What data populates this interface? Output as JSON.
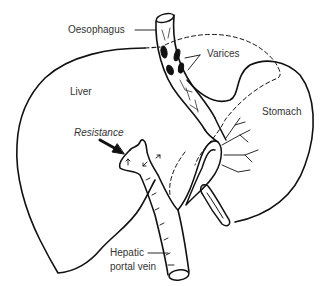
{
  "diagram": {
    "type": "anatomical illustration",
    "labels": {
      "oesophagus": "Oesophagus",
      "varices": "Varices",
      "liver": "Liver",
      "stomach": "Stomach",
      "resistance": "Resistance",
      "hepatic_line1": "Hepatic",
      "hepatic_line2": "portal vein"
    },
    "colors": {
      "line": "#111111",
      "text": "#333333",
      "background": "#ffffff"
    }
  }
}
